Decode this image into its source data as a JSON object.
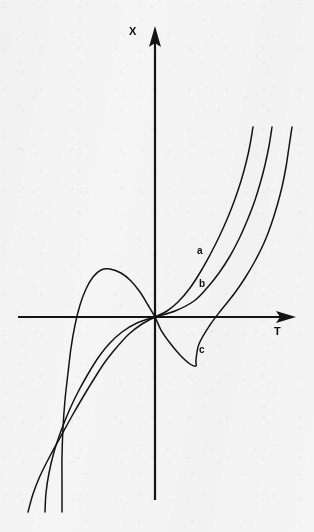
{
  "figure": {
    "background_color": "#f5f5f5",
    "ink_color": "#141414",
    "width": 314,
    "height": 532
  },
  "axes": {
    "vertical": {
      "label": "X",
      "label_x": 129,
      "label_y": 26,
      "arrow_direction": "up",
      "x": 155,
      "y_top": 28,
      "y_bottom": 500
    },
    "horizontal": {
      "label": "T",
      "label_x": 274,
      "label_y": 326,
      "arrow_direction": "right",
      "y": 317,
      "x_left": 18,
      "x_right": 295
    },
    "origin": {
      "x": 155,
      "y": 317
    }
  },
  "curve_labels": [
    {
      "text": "a",
      "x": 197,
      "y": 246
    },
    {
      "text": "b",
      "x": 199,
      "y": 279
    },
    {
      "text": "c",
      "x": 199,
      "y": 345
    }
  ],
  "chart_data": {
    "type": "line",
    "title": "",
    "xlabel": "T",
    "ylabel": "X",
    "grid": false,
    "legend": "inline-curve-labels",
    "axis_arrows": true,
    "series": [
      {
        "name": "a",
        "label": "a",
        "stroke": "#141414",
        "points_px": [
          [
            253,
            127
          ],
          [
            250,
            145
          ],
          [
            246,
            163
          ],
          [
            241,
            181
          ],
          [
            235,
            199
          ],
          [
            228,
            217
          ],
          [
            220,
            235
          ],
          [
            211,
            253
          ],
          [
            201,
            271
          ],
          [
            190,
            288
          ],
          [
            178,
            302
          ],
          [
            167,
            311
          ],
          [
            155,
            317
          ],
          [
            142,
            324
          ],
          [
            129,
            334
          ],
          [
            117,
            347
          ],
          [
            105,
            362
          ],
          [
            94,
            379
          ],
          [
            83,
            397
          ],
          [
            72,
            416
          ],
          [
            61,
            436
          ],
          [
            50,
            456
          ],
          [
            40,
            476
          ],
          [
            33,
            494
          ],
          [
            28,
            512
          ]
        ]
      },
      {
        "name": "b",
        "label": "b",
        "stroke": "#141414",
        "points_px": [
          [
            272,
            127
          ],
          [
            269,
            146
          ],
          [
            265,
            165
          ],
          [
            260,
            184
          ],
          [
            254,
            203
          ],
          [
            247,
            221
          ],
          [
            239,
            239
          ],
          [
            230,
            256
          ],
          [
            219,
            273
          ],
          [
            207,
            288
          ],
          [
            194,
            301
          ],
          [
            175,
            311
          ],
          [
            155,
            317
          ],
          [
            137,
            323
          ],
          [
            122,
            332
          ],
          [
            109,
            344
          ],
          [
            98,
            358
          ],
          [
            88,
            374
          ],
          [
            78,
            392
          ],
          [
            69,
            411
          ],
          [
            61,
            431
          ],
          [
            54,
            452
          ],
          [
            49,
            473
          ],
          [
            46,
            493
          ],
          [
            45,
            512
          ]
        ]
      },
      {
        "name": "c",
        "label": "c",
        "stroke": "#141414",
        "stationary_points": [
          {
            "type": "local-maximum",
            "x_px": 105,
            "y_px": 270
          },
          {
            "type": "local-minimum",
            "x_px": 196,
            "y_px": 366
          }
        ],
        "axis_crossings_px": [
          88,
          155,
          226
        ],
        "points_px": [
          [
            292,
            127
          ],
          [
            289,
            147
          ],
          [
            286,
            167
          ],
          [
            282,
            187
          ],
          [
            277,
            206
          ],
          [
            271,
            225
          ],
          [
            264,
            243
          ],
          [
            255,
            261
          ],
          [
            245,
            278
          ],
          [
            234,
            294
          ],
          [
            222,
            309
          ],
          [
            210,
            325
          ],
          [
            199,
            344
          ],
          [
            196,
            360
          ],
          [
            196,
            366
          ],
          [
            190,
            364
          ],
          [
            180,
            355
          ],
          [
            170,
            343
          ],
          [
            161,
            330
          ],
          [
            155,
            317
          ],
          [
            148,
            305
          ],
          [
            140,
            292
          ],
          [
            131,
            281
          ],
          [
            121,
            273
          ],
          [
            110,
            269
          ],
          [
            101,
            270
          ],
          [
            93,
            277
          ],
          [
            86,
            289
          ],
          [
            80,
            305
          ],
          [
            75,
            325
          ],
          [
            71,
            348
          ],
          [
            68,
            373
          ],
          [
            65,
            400
          ],
          [
            63,
            428
          ],
          [
            62,
            456
          ],
          [
            62,
            484
          ],
          [
            62,
            512
          ]
        ]
      }
    ]
  }
}
